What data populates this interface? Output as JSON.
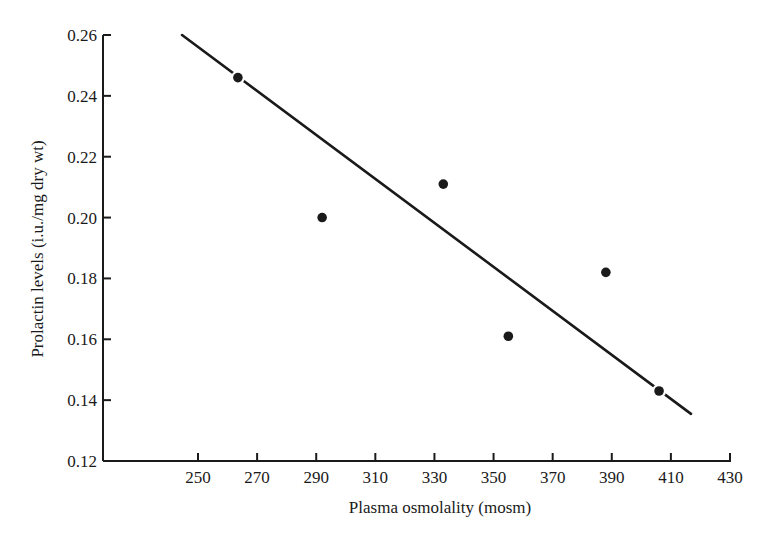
{
  "chart_data": {
    "type": "scatter",
    "title": "",
    "xlabel": "Plasma osmolality (mosm)",
    "ylabel": "Prolactin levels (i.u./mg dry wt)",
    "xlim": [
      230,
      430
    ],
    "ylim": [
      0.12,
      0.26
    ],
    "x_ticks": [
      250,
      270,
      290,
      310,
      330,
      350,
      370,
      390,
      410,
      430
    ],
    "x_tick_labels": [
      "250",
      "270",
      "290",
      "310",
      "330",
      "350",
      "370",
      "390",
      "410",
      "430"
    ],
    "y_ticks": [
      0.12,
      0.14,
      0.16,
      0.18,
      0.2,
      0.22,
      0.24,
      0.26
    ],
    "y_tick_labels": [
      "0.12",
      "0.14",
      "0.16",
      "0.18",
      "0.20",
      "0.22",
      "0.24",
      "0.26"
    ],
    "grid": false,
    "legend": null,
    "series": [
      {
        "name": "observations",
        "type": "scatter",
        "x": [
          263.5,
          292.0,
          333.0,
          355.0,
          388.0,
          406.0
        ],
        "y": [
          0.246,
          0.2,
          0.211,
          0.161,
          0.182,
          0.143
        ]
      },
      {
        "name": "regression line",
        "type": "line",
        "x": [
          244.6,
          416.8
        ],
        "y": [
          0.26,
          0.1355
        ]
      }
    ],
    "colors": {
      "ink": "#1a1a1a",
      "background": "#ffffff"
    }
  }
}
